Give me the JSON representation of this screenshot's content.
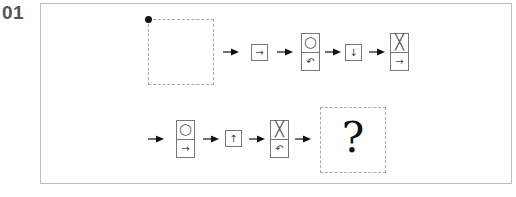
{
  "question": {
    "number": "01",
    "unknown_symbol": "?"
  },
  "sequence": {
    "row1": [
      {
        "type": "start-box"
      },
      {
        "type": "arrow"
      },
      {
        "type": "single",
        "symbol": "→",
        "meaning": "move-right"
      },
      {
        "type": "arrow"
      },
      {
        "type": "double",
        "top": "○",
        "bottom": "↶",
        "meaning": "circle / rotate-counterclockwise"
      },
      {
        "type": "arrow"
      },
      {
        "type": "single",
        "symbol": "↓",
        "meaning": "move-down"
      },
      {
        "type": "arrow"
      },
      {
        "type": "double",
        "top": "╳",
        "bottom": "→",
        "meaning": "cross / move-right"
      }
    ],
    "row2": [
      {
        "type": "arrow"
      },
      {
        "type": "double",
        "top": "○",
        "bottom": "→",
        "meaning": "circle / move-right"
      },
      {
        "type": "arrow"
      },
      {
        "type": "single",
        "symbol": "↑",
        "meaning": "move-up"
      },
      {
        "type": "arrow"
      },
      {
        "type": "double",
        "top": "╳",
        "bottom": "↶",
        "meaning": "cross / rotate-counterclockwise"
      },
      {
        "type": "arrow"
      },
      {
        "type": "answer-box",
        "symbol": "?"
      }
    ]
  },
  "symbols": {
    "r1_s1": "→",
    "r1_d1_top": "○",
    "r1_d1_bottom": "↶",
    "r1_s2": "↓",
    "r1_d2_top": "╳",
    "r1_d2_bottom": "→",
    "r2_d1_top": "○",
    "r2_d1_bottom": "→",
    "r2_s1": "↑",
    "r2_d2_top": "╳",
    "r2_d2_bottom": "↶"
  }
}
